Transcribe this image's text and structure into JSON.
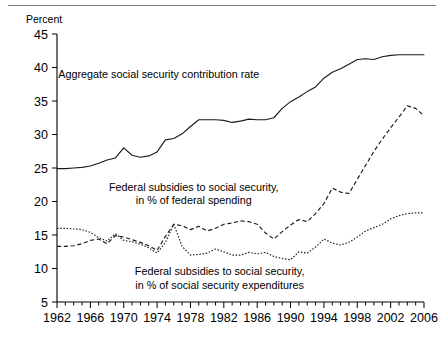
{
  "figure": {
    "ylabel_top": "Percent"
  },
  "chart_data": {
    "type": "line",
    "title": "",
    "subtitle": "",
    "xlabel": "",
    "ylabel": "Percent",
    "xlim": [
      1962,
      2006
    ],
    "ylim": [
      5,
      45
    ],
    "ytick_labels": [
      "5",
      "10",
      "15",
      "20",
      "25",
      "30",
      "35",
      "40",
      "45"
    ],
    "yticks": [
      5,
      10,
      15,
      20,
      25,
      30,
      35,
      40,
      45
    ],
    "xtick_labels": [
      "1962",
      "1966",
      "1970",
      "1974",
      "1978",
      "1982",
      "1986",
      "1990",
      "1994",
      "1998",
      "2002",
      "2006"
    ],
    "xticks": [
      1962,
      1966,
      1970,
      1974,
      1978,
      1982,
      1986,
      1990,
      1994,
      1998,
      2002,
      2006
    ],
    "minor_xtick_interval": 1,
    "grid": false,
    "legend_position": "inline-annotations",
    "x": [
      1962,
      1963,
      1964,
      1965,
      1966,
      1967,
      1968,
      1969,
      1970,
      1971,
      1972,
      1973,
      1974,
      1975,
      1976,
      1977,
      1978,
      1979,
      1980,
      1981,
      1982,
      1983,
      1984,
      1985,
      1986,
      1987,
      1988,
      1989,
      1990,
      1991,
      1992,
      1993,
      1994,
      1995,
      1996,
      1997,
      1998,
      1999,
      2000,
      2001,
      2002,
      2003,
      2004,
      2005,
      2006
    ],
    "series": [
      {
        "name": "Aggregate social security contribution rate",
        "style": "solid",
        "values": [
          24.9,
          24.9,
          25.0,
          25.1,
          25.3,
          25.7,
          26.2,
          26.5,
          28.0,
          26.9,
          26.6,
          26.8,
          27.4,
          29.2,
          29.4,
          30.1,
          31.2,
          32.2,
          32.2,
          32.2,
          32.1,
          31.8,
          32.0,
          32.3,
          32.2,
          32.2,
          32.5,
          33.9,
          34.9,
          35.6,
          36.4,
          37.1,
          38.4,
          39.3,
          39.8,
          40.5,
          41.2,
          41.3,
          41.2,
          41.6,
          41.8,
          41.9,
          41.9,
          41.9,
          41.9
        ]
      },
      {
        "name": "Federal subsidies to social security, in % of federal spending",
        "style": "dashed",
        "values": [
          13.3,
          13.3,
          13.4,
          13.7,
          14.2,
          14.4,
          13.7,
          14.9,
          14.7,
          14.3,
          13.9,
          13.4,
          12.7,
          14.8,
          16.6,
          16.4,
          15.8,
          16.3,
          15.6,
          16.0,
          16.6,
          16.8,
          17.1,
          17.0,
          16.6,
          15.3,
          14.4,
          15.5,
          16.5,
          17.3,
          17.0,
          18.2,
          19.7,
          22.0,
          21.4,
          21.2,
          23.3,
          25.4,
          27.5,
          29.3,
          31.0,
          32.6,
          34.3,
          33.9,
          32.8
        ]
      },
      {
        "name": "Federal subsidies to social security, in % of social security expenditures",
        "style": "dotted",
        "values": [
          16.0,
          16.0,
          15.9,
          15.8,
          15.4,
          14.6,
          14.1,
          15.2,
          14.2,
          14.0,
          13.6,
          13.1,
          12.3,
          13.9,
          16.6,
          13.3,
          12.0,
          12.1,
          12.3,
          12.9,
          12.5,
          12.0,
          12.0,
          12.4,
          12.2,
          12.4,
          11.8,
          11.5,
          11.3,
          12.5,
          12.3,
          13.2,
          14.4,
          13.8,
          13.5,
          13.9,
          14.7,
          15.6,
          16.1,
          16.6,
          17.4,
          17.9,
          18.2,
          18.3,
          18.3
        ]
      }
    ],
    "annotations": [
      {
        "name": "aggregate-contribution-label",
        "lines": [
          "Aggregate social security contribution rate"
        ],
        "x": 1974.2,
        "y": 38.5
      },
      {
        "name": "federal-spending-label",
        "lines": [
          "Federal subsidies to social security,",
          "in % of federal spending"
        ],
        "x": 1978.4,
        "y": 21.6
      },
      {
        "name": "social-security-expenditures-label",
        "lines": [
          "Federal subsidies to social security,",
          "in % of social security expenditures"
        ],
        "x": 1981.5,
        "y": 9.0
      }
    ]
  }
}
